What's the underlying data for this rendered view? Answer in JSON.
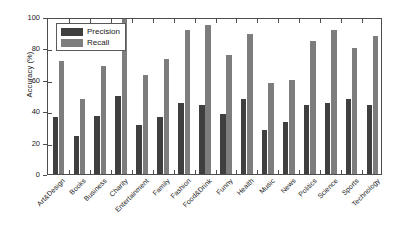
{
  "chart_data": {
    "type": "bar",
    "title": "",
    "xlabel": "",
    "ylabel": "Accuracy (%)",
    "ylim": [
      0,
      100
    ],
    "yticks": [
      0,
      20,
      40,
      60,
      80,
      100
    ],
    "grid": false,
    "legend_position": "upper-left",
    "categories": [
      "Art&Design",
      "Books",
      "Business",
      "Charity",
      "Entertainment",
      "Family",
      "Fashion",
      "Food&Drink",
      "Funny",
      "Health",
      "Music",
      "News",
      "Politics",
      "Science",
      "Sports",
      "Technology"
    ],
    "series": [
      {
        "name": "Precision",
        "color": "#3f3f3f",
        "values": [
          36,
          24,
          37,
          50,
          31,
          36,
          45,
          44,
          38,
          48,
          28,
          33,
          44,
          45,
          48,
          44
        ]
      },
      {
        "name": "Recall",
        "color": "#7d7d7d",
        "values": [
          72,
          48,
          69,
          100,
          63,
          73,
          92,
          95,
          76,
          89,
          58,
          60,
          85,
          92,
          80,
          88
        ]
      }
    ]
  },
  "legend": {
    "items": [
      {
        "label": "Precision"
      },
      {
        "label": "Recall"
      }
    ]
  }
}
